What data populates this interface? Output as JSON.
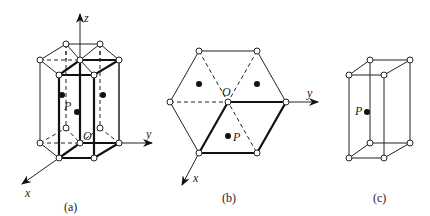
{
  "figures": [
    {
      "id": "a",
      "caption": "(a)",
      "axes": {
        "x": "x",
        "y": "y",
        "z": "z"
      },
      "origin_label": "O",
      "point_label": "P",
      "description": "Hexagonal prism lattice with primitive cell highlighted"
    },
    {
      "id": "b",
      "caption": "(b)",
      "axes": {
        "x": "x",
        "y": "y"
      },
      "origin_label": "O",
      "point_label": "P",
      "description": "Top view of hexagonal lattice"
    },
    {
      "id": "c",
      "caption": "(c)",
      "point_label": "P",
      "description": "Primitive cell"
    }
  ]
}
